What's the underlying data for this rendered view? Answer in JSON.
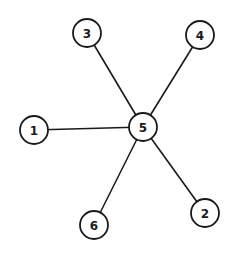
{
  "diagram": {
    "type": "star-graph",
    "center": "5",
    "nodes": [
      {
        "id": "1",
        "label": "1",
        "x": 34,
        "y": 130
      },
      {
        "id": "2",
        "label": "2",
        "x": 205,
        "y": 213
      },
      {
        "id": "3",
        "label": "3",
        "x": 87,
        "y": 33
      },
      {
        "id": "4",
        "label": "4",
        "x": 200,
        "y": 35
      },
      {
        "id": "5",
        "label": "5",
        "x": 143,
        "y": 127
      },
      {
        "id": "6",
        "label": "6",
        "x": 94,
        "y": 225
      }
    ],
    "edges": [
      {
        "from": "5",
        "to": "1"
      },
      {
        "from": "5",
        "to": "2"
      },
      {
        "from": "5",
        "to": "3"
      },
      {
        "from": "5",
        "to": "4"
      },
      {
        "from": "5",
        "to": "6"
      }
    ],
    "node_radius": 14,
    "colors": {
      "stroke": "#1a1a1a",
      "fill": "#ffffff",
      "background": "#ffffff"
    }
  }
}
